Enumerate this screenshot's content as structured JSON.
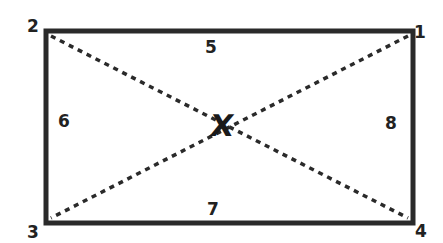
{
  "diagram": {
    "type": "rectangle-with-diagonals",
    "colors": {
      "stroke": "#2a2a2a",
      "background": "#ffffff",
      "text": "#222222"
    },
    "corners": [
      {
        "id": "corner-1",
        "label": "1",
        "position": "top-right"
      },
      {
        "id": "corner-2",
        "label": "2",
        "position": "top-left"
      },
      {
        "id": "corner-3",
        "label": "3",
        "position": "bottom-left"
      },
      {
        "id": "corner-4",
        "label": "4",
        "position": "bottom-right"
      }
    ],
    "edges": [
      {
        "id": "edge-5",
        "label": "5",
        "position": "top"
      },
      {
        "id": "edge-6",
        "label": "6",
        "position": "left"
      },
      {
        "id": "edge-7",
        "label": "7",
        "position": "bottom"
      },
      {
        "id": "edge-8",
        "label": "8",
        "position": "right"
      }
    ],
    "diagonals": [
      {
        "from": "2",
        "to": "4",
        "style": "dotted"
      },
      {
        "from": "1",
        "to": "3",
        "style": "dotted"
      }
    ],
    "center": {
      "label": "X"
    }
  }
}
